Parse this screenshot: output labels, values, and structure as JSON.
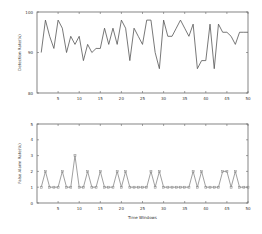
{
  "chart_data": [
    {
      "type": "line",
      "title": "",
      "xlabel": "",
      "ylabel": "Detection Rate(%)",
      "xlim": [
        0,
        50
      ],
      "ylim": [
        80,
        100
      ],
      "xticks": [
        5,
        10,
        15,
        20,
        25,
        30,
        35,
        40,
        45,
        50
      ],
      "yticks": [
        80,
        90,
        100
      ],
      "grid": false,
      "x": [
        1,
        2,
        3,
        4,
        5,
        6,
        7,
        8,
        9,
        10,
        11,
        12,
        13,
        14,
        15,
        16,
        17,
        18,
        19,
        20,
        21,
        22,
        23,
        24,
        25,
        26,
        27,
        28,
        29,
        30,
        31,
        32,
        33,
        34,
        35,
        36,
        37,
        38,
        39,
        40,
        41,
        42,
        43,
        44,
        45,
        46,
        47,
        48,
        49,
        50
      ],
      "series": [
        {
          "name": "Detection Rate",
          "color": "#555555",
          "values": [
            90,
            98,
            94,
            91,
            98,
            96,
            90,
            94,
            92,
            94,
            88,
            92,
            90,
            91,
            91,
            96,
            92,
            96,
            92,
            98,
            96,
            88,
            96,
            94,
            92,
            98,
            98,
            90,
            86,
            98,
            94,
            94,
            96,
            98,
            96,
            94,
            97,
            86,
            88,
            88,
            97,
            86,
            97,
            95,
            95,
            94,
            92,
            95,
            95,
            95
          ]
        }
      ]
    },
    {
      "type": "line",
      "title": "",
      "xlabel": "Time Windows",
      "ylabel": "False Alarm Rate(%)",
      "xlim": [
        0,
        50
      ],
      "ylim": [
        0,
        5
      ],
      "xticks": [
        5,
        10,
        15,
        20,
        25,
        30,
        35,
        40,
        45,
        50
      ],
      "yticks": [
        0,
        1,
        2,
        3,
        4,
        5
      ],
      "grid": false,
      "marker": "square",
      "x": [
        1,
        2,
        3,
        4,
        5,
        6,
        7,
        8,
        9,
        10,
        11,
        12,
        13,
        14,
        15,
        16,
        17,
        18,
        19,
        20,
        21,
        22,
        23,
        24,
        25,
        26,
        27,
        28,
        29,
        30,
        31,
        32,
        33,
        34,
        35,
        36,
        37,
        38,
        39,
        40,
        41,
        42,
        43,
        44,
        45,
        46,
        47,
        48,
        49,
        50
      ],
      "series": [
        {
          "name": "False Alarm Rate",
          "color": "#888888",
          "values": [
            1,
            2,
            1,
            1,
            1,
            2,
            1,
            1,
            3,
            1,
            1,
            2,
            1,
            1,
            2,
            1,
            1,
            1,
            2,
            1,
            2,
            1,
            1,
            1,
            1,
            1,
            2,
            1,
            2,
            1,
            1,
            1,
            1,
            1,
            1,
            1,
            2,
            1,
            2,
            1,
            1,
            1,
            1,
            2,
            2,
            1,
            2,
            1,
            1,
            1
          ]
        }
      ]
    }
  ]
}
